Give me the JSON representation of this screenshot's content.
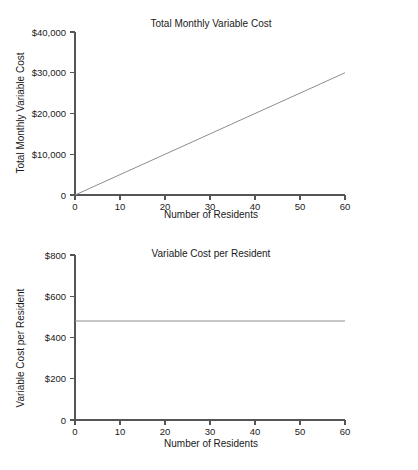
{
  "page": {
    "background_color": "#ffffff",
    "line_color": "#8d8d8d",
    "axis_color": "#555555",
    "text_color": "#1a1a1a",
    "footer_caption": ""
  },
  "chart_data": [
    {
      "id": "total-monthly-variable-cost",
      "type": "line",
      "title": "Total Monthly Variable Cost",
      "xlabel": "Number of Residents",
      "ylabel": "Total Monthly Variable Cost",
      "x": [
        0,
        60
      ],
      "values": [
        0,
        30000
      ],
      "slope_per_unit": 500,
      "xlim": [
        0,
        60
      ],
      "ylim": [
        0,
        40000
      ],
      "xticks": [
        0,
        10,
        20,
        30,
        40,
        50,
        60
      ],
      "xticklabels": [
        "0",
        "10",
        "20",
        "30",
        "40",
        "50",
        "60"
      ],
      "yticks": [
        0,
        10000,
        20000,
        30000,
        40000
      ],
      "yticklabels": [
        "0",
        "$10,000",
        "$20,000",
        "$30,000",
        "$40,000"
      ],
      "grid": false,
      "legend": false
    },
    {
      "id": "variable-cost-per-resident",
      "type": "line",
      "title": "Variable Cost per Resident",
      "xlabel": "Number of Residents",
      "ylabel": "Variable Cost per Resident",
      "x": [
        0,
        60
      ],
      "values": [
        480,
        480
      ],
      "constant_value": 480,
      "xlim": [
        0,
        60
      ],
      "ylim": [
        0,
        800
      ],
      "xticks": [
        0,
        10,
        20,
        30,
        40,
        50,
        60
      ],
      "xticklabels": [
        "0",
        "10",
        "20",
        "30",
        "40",
        "50",
        "60"
      ],
      "yticks": [
        0,
        200,
        400,
        600,
        800
      ],
      "yticklabels": [
        "0",
        "$200",
        "$400",
        "$600",
        "$800"
      ],
      "grid": false,
      "legend": false
    }
  ]
}
